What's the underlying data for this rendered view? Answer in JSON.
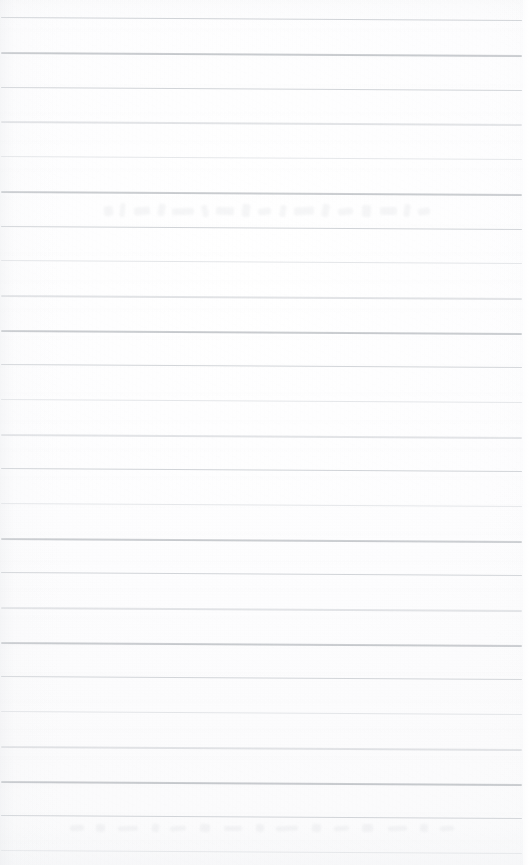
{
  "document": {
    "kind": "scanned-lined-notebook-page",
    "title": "Scanned Lined Notebook Page",
    "orientation": "portrait",
    "width_px": 531,
    "height_px": 865,
    "text_content": "",
    "has_visible_text": false,
    "notes_visible": "none"
  },
  "paper": {
    "background_color": "#fdfdfd",
    "tint_color": "#f8f9fa",
    "edge_shadow_color": "#e4e6e9",
    "grain_opacity": 0.55
  },
  "ruling": {
    "line_count": 25,
    "first_line_y": 17,
    "spacing_px": 34.6,
    "left_x": 1,
    "right_x": 522,
    "slope_px": 3,
    "light_color": "#d6d9dd",
    "medium_color": "#c2c6cb",
    "dark_color": "#9ea3a9",
    "lines": [
      {
        "y": 17,
        "tone": "medium",
        "opacity": 0.78,
        "thickness": 1.4
      },
      {
        "y": 52,
        "tone": "dark",
        "opacity": 0.95,
        "thickness": 1.7
      },
      {
        "y": 87,
        "tone": "medium",
        "opacity": 0.74,
        "thickness": 1.4
      },
      {
        "y": 121,
        "tone": "medium",
        "opacity": 0.8,
        "thickness": 1.5
      },
      {
        "y": 156,
        "tone": "light",
        "opacity": 0.62,
        "thickness": 1.3
      },
      {
        "y": 191,
        "tone": "dark",
        "opacity": 0.92,
        "thickness": 1.7
      },
      {
        "y": 226,
        "tone": "medium",
        "opacity": 0.76,
        "thickness": 1.4
      },
      {
        "y": 260,
        "tone": "light",
        "opacity": 0.66,
        "thickness": 1.3
      },
      {
        "y": 295,
        "tone": "medium",
        "opacity": 0.82,
        "thickness": 1.5
      },
      {
        "y": 330,
        "tone": "dark",
        "opacity": 0.94,
        "thickness": 1.7
      },
      {
        "y": 364,
        "tone": "medium",
        "opacity": 0.72,
        "thickness": 1.4
      },
      {
        "y": 399,
        "tone": "light",
        "opacity": 0.64,
        "thickness": 1.3
      },
      {
        "y": 434,
        "tone": "medium",
        "opacity": 0.8,
        "thickness": 1.5
      },
      {
        "y": 468,
        "tone": "medium",
        "opacity": 0.76,
        "thickness": 1.4
      },
      {
        "y": 503,
        "tone": "light",
        "opacity": 0.6,
        "thickness": 1.3
      },
      {
        "y": 538,
        "tone": "dark",
        "opacity": 0.9,
        "thickness": 1.6
      },
      {
        "y": 572,
        "tone": "medium",
        "opacity": 0.74,
        "thickness": 1.4
      },
      {
        "y": 607,
        "tone": "medium",
        "opacity": 0.78,
        "thickness": 1.5
      },
      {
        "y": 642,
        "tone": "dark",
        "opacity": 0.92,
        "thickness": 1.7
      },
      {
        "y": 676,
        "tone": "medium",
        "opacity": 0.72,
        "thickness": 1.4
      },
      {
        "y": 711,
        "tone": "light",
        "opacity": 0.66,
        "thickness": 1.3
      },
      {
        "y": 746,
        "tone": "medium",
        "opacity": 0.8,
        "thickness": 1.5
      },
      {
        "y": 781,
        "tone": "dark",
        "opacity": 0.95,
        "thickness": 1.7
      },
      {
        "y": 815,
        "tone": "medium",
        "opacity": 0.74,
        "thickness": 1.4
      },
      {
        "y": 850,
        "tone": "light",
        "opacity": 0.58,
        "thickness": 1.3
      }
    ]
  },
  "bleed_through": {
    "present": true,
    "description": "faint illegible ghost of handwriting from the reverse side",
    "bands": [
      {
        "y": 200,
        "x": 104,
        "width": 330,
        "height": 22,
        "marks": [
          {
            "x": 0,
            "y": 6,
            "w": 9,
            "h": 10,
            "r": -8
          },
          {
            "x": 16,
            "y": 3,
            "w": 5,
            "h": 14,
            "r": 6
          },
          {
            "x": 30,
            "y": 7,
            "w": 16,
            "h": 8,
            "r": -4
          },
          {
            "x": 54,
            "y": 4,
            "w": 7,
            "h": 12,
            "r": 10
          },
          {
            "x": 68,
            "y": 8,
            "w": 22,
            "h": 7,
            "r": -2
          },
          {
            "x": 98,
            "y": 5,
            "w": 6,
            "h": 12,
            "r": -12
          },
          {
            "x": 112,
            "y": 7,
            "w": 18,
            "h": 8,
            "r": 3
          },
          {
            "x": 138,
            "y": 4,
            "w": 8,
            "h": 13,
            "r": 7
          },
          {
            "x": 154,
            "y": 8,
            "w": 13,
            "h": 7,
            "r": -5
          },
          {
            "x": 176,
            "y": 5,
            "w": 6,
            "h": 12,
            "r": 9
          },
          {
            "x": 190,
            "y": 7,
            "w": 20,
            "h": 8,
            "r": -3
          },
          {
            "x": 218,
            "y": 4,
            "w": 7,
            "h": 13,
            "r": 11
          },
          {
            "x": 234,
            "y": 8,
            "w": 15,
            "h": 7,
            "r": -6
          },
          {
            "x": 258,
            "y": 5,
            "w": 9,
            "h": 12,
            "r": 4
          },
          {
            "x": 276,
            "y": 7,
            "w": 17,
            "h": 8,
            "r": -1
          },
          {
            "x": 300,
            "y": 4,
            "w": 6,
            "h": 13,
            "r": 8
          },
          {
            "x": 314,
            "y": 8,
            "w": 12,
            "h": 7,
            "r": -7
          }
        ]
      },
      {
        "y": 820,
        "x": 70,
        "width": 400,
        "height": 16,
        "marks": [
          {
            "x": 0,
            "y": 5,
            "w": 14,
            "h": 6,
            "r": -3
          },
          {
            "x": 26,
            "y": 4,
            "w": 9,
            "h": 8,
            "r": 5
          },
          {
            "x": 48,
            "y": 6,
            "w": 20,
            "h": 5,
            "r": -2
          },
          {
            "x": 82,
            "y": 4,
            "w": 7,
            "h": 8,
            "r": 7
          },
          {
            "x": 100,
            "y": 6,
            "w": 16,
            "h": 5,
            "r": -4
          },
          {
            "x": 130,
            "y": 4,
            "w": 10,
            "h": 8,
            "r": 3
          },
          {
            "x": 154,
            "y": 6,
            "w": 18,
            "h": 5,
            "r": -1
          },
          {
            "x": 186,
            "y": 4,
            "w": 8,
            "h": 8,
            "r": 6
          },
          {
            "x": 206,
            "y": 6,
            "w": 22,
            "h": 5,
            "r": -3
          },
          {
            "x": 242,
            "y": 4,
            "w": 9,
            "h": 8,
            "r": 4
          },
          {
            "x": 264,
            "y": 6,
            "w": 15,
            "h": 5,
            "r": -5
          },
          {
            "x": 292,
            "y": 4,
            "w": 11,
            "h": 8,
            "r": 2
          },
          {
            "x": 318,
            "y": 6,
            "w": 19,
            "h": 5,
            "r": -2
          },
          {
            "x": 350,
            "y": 4,
            "w": 8,
            "h": 8,
            "r": 5
          },
          {
            "x": 370,
            "y": 6,
            "w": 14,
            "h": 5,
            "r": -4
          }
        ]
      }
    ]
  }
}
